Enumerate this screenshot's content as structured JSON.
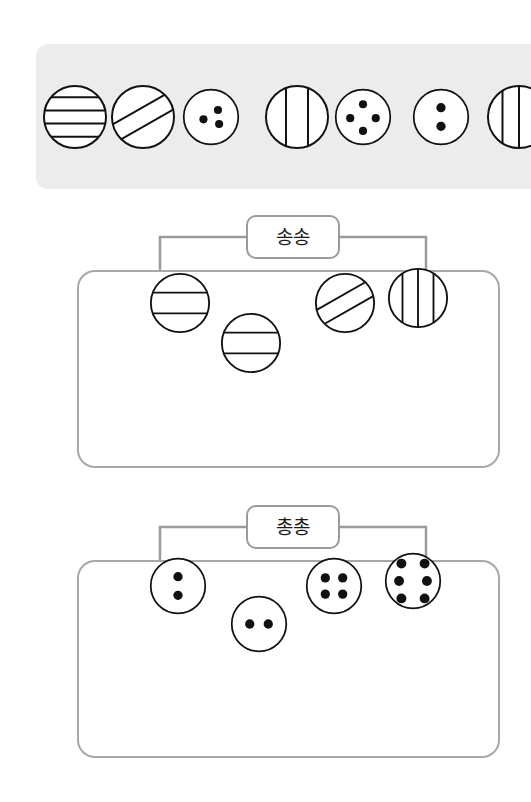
{
  "page": {
    "background_color": "#ffffff"
  },
  "source_strip": {
    "name": "unsorted-pattern-tray",
    "background_color": "#ececec",
    "items": [
      {
        "id": "s1",
        "pattern": "horizontal-lines",
        "count": 4,
        "x": 42,
        "diameter": 66,
        "clipped": false
      },
      {
        "id": "s2",
        "pattern": "diagonal-lines",
        "count": 2,
        "x": 110,
        "diameter": 66,
        "clipped": false
      },
      {
        "id": "s3",
        "pattern": "dots",
        "count": 3,
        "x": 182,
        "diameter": 58,
        "clipped": false
      },
      {
        "id": "s4",
        "pattern": "vertical-lines",
        "count": 2,
        "x": 264,
        "diameter": 66,
        "clipped": false
      },
      {
        "id": "s5",
        "pattern": "dots",
        "count": 4,
        "x": 334,
        "diameter": 58,
        "clipped": false
      },
      {
        "id": "s6",
        "pattern": "dots",
        "count": 2,
        "x": 412,
        "diameter": 58,
        "clipped": false
      },
      {
        "id": "s7",
        "pattern": "vertical-lines",
        "count": 3,
        "x": 486,
        "diameter": 66,
        "clipped": true
      }
    ]
  },
  "groups": [
    {
      "id": "group-songsong",
      "label": "송송",
      "meaning_hint": "striped",
      "top": 215,
      "items": [
        {
          "id": "g1a",
          "pattern": "horizontal-lines",
          "count": 2,
          "x": 147,
          "y": 55,
          "diameter": 62
        },
        {
          "id": "g1b",
          "pattern": "horizontal-lines",
          "count": 2,
          "x": 218,
          "y": 95,
          "diameter": 62
        },
        {
          "id": "g1c",
          "pattern": "diagonal-lines",
          "count": 2,
          "x": 312,
          "y": 55,
          "diameter": 62
        },
        {
          "id": "g1d",
          "pattern": "vertical-lines",
          "count": 3,
          "x": 385,
          "y": 50,
          "diameter": 62
        }
      ]
    },
    {
      "id": "group-chongchong",
      "label": "총총",
      "meaning_hint": "dotted",
      "top": 505,
      "items": [
        {
          "id": "g2a",
          "pattern": "dots",
          "count": 2,
          "arrangement": "vertical",
          "x": 147,
          "y": 50,
          "diameter": 58
        },
        {
          "id": "g2b",
          "pattern": "dots",
          "count": 2,
          "arrangement": "horizontal",
          "x": 228,
          "y": 88,
          "diameter": 58
        },
        {
          "id": "g2c",
          "pattern": "dots",
          "count": 4,
          "arrangement": "square",
          "x": 303,
          "y": 50,
          "diameter": 58
        },
        {
          "id": "g2d",
          "pattern": "dots",
          "count": 6,
          "arrangement": "ring",
          "x": 382,
          "y": 45,
          "diameter": 58
        }
      ]
    }
  ],
  "style": {
    "circle_stroke": "#111111",
    "dot_fill": "#111111",
    "box_stroke": "#a8a8a8",
    "label_stroke": "#9b9b9b",
    "connector_stroke": "#9b9b9b"
  }
}
